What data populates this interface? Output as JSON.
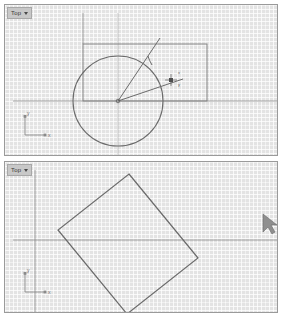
{
  "app": {
    "background_color": "#ffffff",
    "viewport_bg_color": "#e3e3e3",
    "geometry_color": "#6b6b6b",
    "grid_minor_color": "#ffffff",
    "grid_major_color": "#969696"
  },
  "viewports": [
    {
      "id": "top-viewport",
      "label": "Top",
      "has_dropdown_caret": true,
      "axis_gizmo": {
        "x_label": "x",
        "y_label": "y"
      },
      "snap_tooltip": {
        "line1": "x",
        "line2": "y"
      },
      "geometry": {
        "circle": {
          "cx": 113,
          "cy": 96,
          "r": 45
        },
        "rectangle": {
          "x": 78,
          "y": 39,
          "width": 124,
          "height": 57
        },
        "vertical_construction_line": {
          "x": 78,
          "y1": 8,
          "y2": 39
        },
        "horizontal_axis_line": {
          "y": 96,
          "x1": 8,
          "x2": 272
        },
        "vertical_axis_line": {
          "x": 113,
          "y1": 8,
          "y2": 150
        },
        "radius_line_1": {
          "x1": 113,
          "y1": 96,
          "x2": 155,
          "y2": 33
        },
        "radius_line_2": {
          "x1": 113,
          "y1": 96,
          "x2": 178,
          "y2": 74
        },
        "angle_arc_tick": true,
        "center_marker": true,
        "snap_marker": {
          "x": 166,
          "y": 75
        }
      }
    },
    {
      "id": "bottom-viewport",
      "label": "Top",
      "has_dropdown_caret": true,
      "axis_gizmo": {
        "x_label": "x",
        "y_label": "y"
      },
      "geometry": {
        "rectangle_base": {
          "x": 30,
          "y": 8,
          "width": 244,
          "height": 70
        },
        "rotated_rectangle_points": "124,12 193,96 122,152 53,68",
        "horizontal_axis_line": {
          "y": 78,
          "x1": 8,
          "x2": 272
        },
        "vertical_axis_line": {
          "x": 30,
          "y1": 8,
          "y2": 150
        }
      },
      "cursor": {
        "x": 263,
        "y": 60,
        "type": "arrow-pointer"
      }
    }
  ]
}
